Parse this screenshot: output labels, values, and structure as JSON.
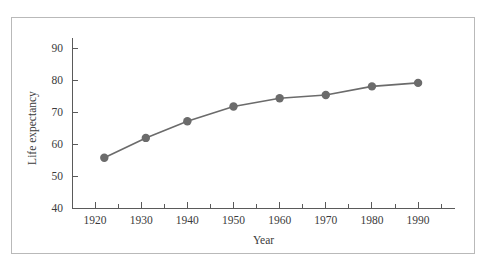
{
  "figure": {
    "border_color": "#b9b9b9",
    "background": "#ffffff"
  },
  "chart_data": {
    "type": "line",
    "title": "",
    "xlabel": "Year",
    "ylabel": "Life expectancy",
    "xlim": [
      1915,
      1998
    ],
    "ylim": [
      40,
      94
    ],
    "xticks": [
      1920,
      1930,
      1940,
      1950,
      1960,
      1970,
      1980,
      1990
    ],
    "xtick_labels": [
      "1920",
      "1930",
      "1940",
      "1950",
      "1960",
      "1970",
      "1980",
      "1990"
    ],
    "xminor_ticks": [
      1925,
      1935,
      1945,
      1955,
      1965,
      1975,
      1985,
      1995
    ],
    "yticks": [
      40,
      50,
      60,
      70,
      80,
      90
    ],
    "ytick_labels": [
      "40",
      "50",
      "60",
      "70",
      "80",
      "90"
    ],
    "grid": false,
    "legend": "none",
    "series": [
      {
        "name": "Life expectancy",
        "color": "#6b6b6b",
        "marker": "circle",
        "marker_size": 4.2,
        "x": [
          1922,
          1931,
          1940,
          1950,
          1960,
          1970,
          1980,
          1990
        ],
        "values": [
          55.7,
          61.9,
          67.1,
          71.7,
          74.3,
          75.3,
          78.0,
          79.1
        ]
      }
    ]
  }
}
